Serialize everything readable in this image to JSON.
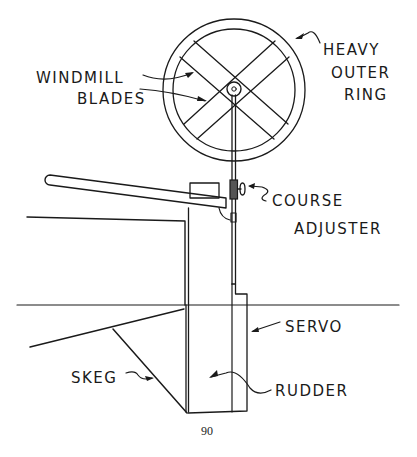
{
  "figure": {
    "page_number": "90",
    "labels": {
      "windmill_blades_line1": "WINDMILL",
      "windmill_blades_line2": "BLADES",
      "heavy_outer_ring_line1": "HEAVY",
      "heavy_outer_ring_line2": "OUTER",
      "heavy_outer_ring_line3": "RING",
      "course_adjuster_line1": "COURSE",
      "course_adjuster_line2": "ADJUSTER",
      "servo": "SERVO",
      "skeg": "SKEG",
      "rudder": "RUDDER"
    },
    "colors": {
      "ink": "#1a1a1a",
      "paper": "#ffffff"
    }
  }
}
